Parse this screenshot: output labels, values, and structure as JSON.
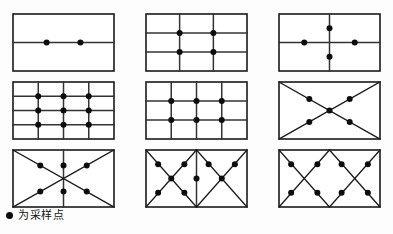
{
  "figure": {
    "caption_marker": "●",
    "caption_text": "为采样点",
    "line_color": "#333333",
    "border_color": "#1a1a1a",
    "dot_color": "#0d0d0d",
    "background_color": "#fdfdfd",
    "columns": 3,
    "rows": 3,
    "panel_count": 9
  },
  "chart_data": {
    "type": "diagram",
    "title": "",
    "legend": "● 为采样点",
    "panel_width": 101,
    "panel_height": 57,
    "panels": [
      {
        "index": 1,
        "name": "two-points-on-midline",
        "x": 13,
        "y": 14,
        "h_lines": [
          0.5
        ],
        "v_lines": [],
        "diagonals": [],
        "dots": [
          [
            0.333,
            0.5
          ],
          [
            0.667,
            0.5
          ]
        ],
        "dot_count": 2
      },
      {
        "index": 2,
        "name": "four-points-grid-2x2",
        "x": 146,
        "y": 14,
        "h_lines": [
          0.333,
          0.667
        ],
        "v_lines": [
          0.333,
          0.667
        ],
        "diagonals": [],
        "dots": [
          [
            0.333,
            0.333
          ],
          [
            0.667,
            0.333
          ],
          [
            0.333,
            0.667
          ],
          [
            0.667,
            0.667
          ]
        ],
        "dot_count": 4
      },
      {
        "index": 3,
        "name": "four-points-cross",
        "x": 279,
        "y": 14,
        "h_lines": [
          0.5
        ],
        "v_lines": [
          0.5
        ],
        "diagonals": [],
        "dots": [
          [
            0.5,
            0.25
          ],
          [
            0.25,
            0.5
          ],
          [
            0.75,
            0.5
          ],
          [
            0.5,
            0.75
          ]
        ],
        "dot_count": 4
      },
      {
        "index": 4,
        "name": "nine-points-grid-3x3",
        "x": 13,
        "y": 82,
        "h_lines": [
          0.25,
          0.5,
          0.75
        ],
        "v_lines": [
          0.25,
          0.5,
          0.75
        ],
        "diagonals": [],
        "dots": [
          [
            0.25,
            0.25
          ],
          [
            0.5,
            0.25
          ],
          [
            0.75,
            0.25
          ],
          [
            0.25,
            0.5
          ],
          [
            0.5,
            0.5
          ],
          [
            0.75,
            0.5
          ],
          [
            0.25,
            0.75
          ],
          [
            0.5,
            0.75
          ],
          [
            0.75,
            0.75
          ]
        ],
        "dot_count": 9
      },
      {
        "index": 5,
        "name": "six-points-grid-2x3",
        "x": 146,
        "y": 82,
        "h_lines": [
          0.333,
          0.667
        ],
        "v_lines": [
          0.25,
          0.5,
          0.75
        ],
        "diagonals": [],
        "dots": [
          [
            0.25,
            0.333
          ],
          [
            0.5,
            0.333
          ],
          [
            0.75,
            0.333
          ],
          [
            0.25,
            0.667
          ],
          [
            0.5,
            0.667
          ],
          [
            0.75,
            0.667
          ]
        ],
        "dot_count": 6
      },
      {
        "index": 6,
        "name": "five-points-diagonal-cross",
        "x": 279,
        "y": 82,
        "h_lines": [],
        "v_lines": [],
        "diagonals": [
          [
            0,
            0,
            1,
            1
          ],
          [
            1,
            0,
            0,
            1
          ]
        ],
        "dots": [
          [
            0.3,
            0.3
          ],
          [
            0.7,
            0.3
          ],
          [
            0.5,
            0.5
          ],
          [
            0.3,
            0.7
          ],
          [
            0.7,
            0.7
          ]
        ],
        "dot_count": 5
      },
      {
        "index": 7,
        "name": "six-points-diagonal-cross-with-midline",
        "x": 13,
        "y": 150,
        "h_lines": [],
        "v_lines": [
          0.5
        ],
        "diagonals": [
          [
            0,
            0,
            1,
            1
          ],
          [
            1,
            0,
            0,
            1
          ]
        ],
        "dots": [
          [
            0.27,
            0.27
          ],
          [
            0.5,
            0.27
          ],
          [
            0.73,
            0.27
          ],
          [
            0.27,
            0.73
          ],
          [
            0.5,
            0.73
          ],
          [
            0.73,
            0.73
          ]
        ],
        "dot_count": 6
      },
      {
        "index": 8,
        "name": "nine-points-double-diagonal-cross",
        "x": 146,
        "y": 150,
        "h_lines": [],
        "v_lines": [
          0.5
        ],
        "diagonals": [
          [
            0,
            0,
            0.5,
            1
          ],
          [
            0.5,
            0,
            0,
            1
          ],
          [
            0.5,
            0,
            1,
            1
          ],
          [
            1,
            0,
            0.5,
            1
          ]
        ],
        "dots": [
          [
            0.12,
            0.25
          ],
          [
            0.38,
            0.25
          ],
          [
            0.62,
            0.25
          ],
          [
            0.88,
            0.25
          ],
          [
            0.25,
            0.5
          ],
          [
            0.5,
            0.5
          ],
          [
            0.75,
            0.5
          ],
          [
            0.12,
            0.75
          ],
          [
            0.38,
            0.75
          ],
          [
            0.62,
            0.75
          ],
          [
            0.88,
            0.75
          ]
        ],
        "dot_count": 9
      },
      {
        "index": 9,
        "name": "eight-points-zigzag-diagonals",
        "x": 279,
        "y": 150,
        "h_lines": [],
        "v_lines": [],
        "diagonals": [
          [
            0,
            0,
            0.5,
            1
          ],
          [
            0.5,
            0,
            0,
            1
          ],
          [
            0.5,
            0,
            1,
            1
          ],
          [
            1,
            0,
            0.5,
            1
          ]
        ],
        "dots": [
          [
            0.12,
            0.25
          ],
          [
            0.38,
            0.25
          ],
          [
            0.62,
            0.25
          ],
          [
            0.88,
            0.25
          ],
          [
            0.12,
            0.75
          ],
          [
            0.38,
            0.75
          ],
          [
            0.62,
            0.75
          ],
          [
            0.88,
            0.75
          ]
        ],
        "dot_count": 8
      }
    ]
  }
}
